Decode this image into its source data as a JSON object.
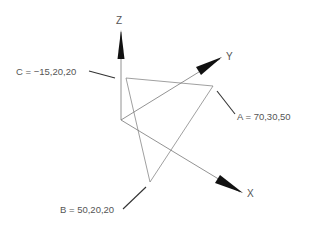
{
  "diagram": {
    "type": "3d-coordinate-triangle",
    "axes": {
      "x": {
        "label": "X"
      },
      "y": {
        "label": "Y"
      },
      "z": {
        "label": "Z"
      }
    },
    "points": [
      {
        "name": "A",
        "coords": "70,30,50",
        "label": "A = 70,30,50"
      },
      {
        "name": "B",
        "coords": "50,20,20",
        "label": "B = 50,20,20"
      },
      {
        "name": "C",
        "coords": "−15,20,20",
        "label": "C = −15,20,20"
      }
    ],
    "colors": {
      "line": "#666666",
      "arrow": "#111111",
      "text": "#555555",
      "background": "#ffffff"
    }
  }
}
